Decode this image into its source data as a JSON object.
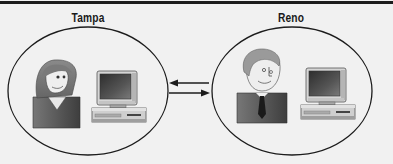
{
  "diagram": {
    "sites": [
      {
        "label": "Tampa",
        "person": "woman",
        "device": "desktop-computer"
      },
      {
        "label": "Reno",
        "person": "man",
        "device": "desktop-computer"
      }
    ],
    "connection": {
      "arrows": [
        "left-pointing (Reno to Tampa)",
        "right-pointing (Tampa to Reno)"
      ],
      "type": "bidirectional"
    }
  },
  "colors": {
    "background": "#f1f1f1",
    "outline": "#1c1c1c",
    "shirt": "#5a5a5a",
    "hair_woman": "#7a7a7a",
    "hair_man": "#9a9a9a",
    "skin": "#eeeeee",
    "monitor_case": "#d0d0d0",
    "screen": "#4a4a4a"
  }
}
